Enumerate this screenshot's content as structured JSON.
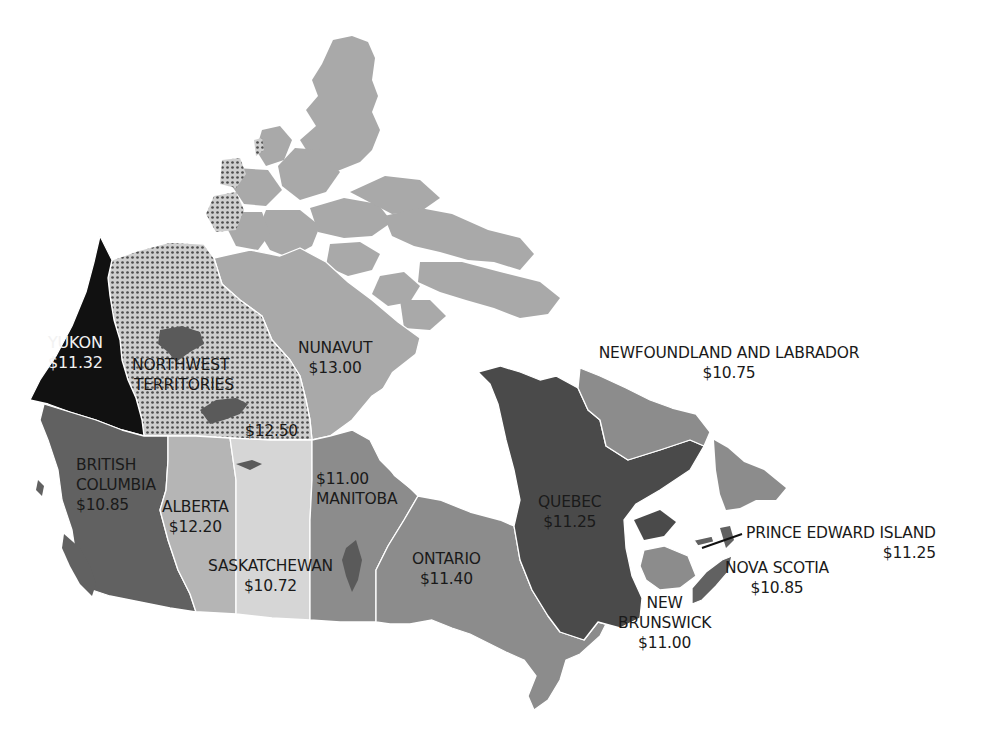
{
  "map": {
    "type": "choropleth",
    "subject": "Canada provinces and territories",
    "colors": {
      "black": "#111111",
      "dark": "#4a4a4a",
      "darkmid": "#616161",
      "mid": "#8c8c8c",
      "lightmid": "#a9a9a9",
      "light": "#b5b5b5",
      "lightest": "#d6d6d6",
      "dotted_base": "#c8c8c8",
      "dot": "#555555",
      "lake": "#5a5a5a",
      "background": "#ffffff"
    },
    "regions": [
      {
        "id": "yukon",
        "name_lines": [
          "YUKON"
        ],
        "value": "$11.32",
        "shade": "black"
      },
      {
        "id": "northwest-territories",
        "name_lines": [
          "NORTHWEST",
          "TERRITORIES"
        ],
        "value": "$12.50",
        "shade": "dotted"
      },
      {
        "id": "nunavut",
        "name_lines": [
          "NUNAVUT"
        ],
        "value": "$13.00",
        "shade": "lightmid"
      },
      {
        "id": "british-columbia",
        "name_lines": [
          "BRITISH",
          "COLUMBIA"
        ],
        "value": "$10.85",
        "shade": "darkmid"
      },
      {
        "id": "alberta",
        "name_lines": [
          "ALBERTA"
        ],
        "value": "$12.20",
        "shade": "light"
      },
      {
        "id": "saskatchewan",
        "name_lines": [
          "SASKATCHEWAN"
        ],
        "value": "$10.72",
        "shade": "lightest"
      },
      {
        "id": "manitoba",
        "name_lines": [
          "MANITOBA"
        ],
        "value": "$11.00",
        "shade": "mid"
      },
      {
        "id": "ontario",
        "name_lines": [
          "ONTARIO"
        ],
        "value": "$11.40",
        "shade": "mid"
      },
      {
        "id": "quebec",
        "name_lines": [
          "QUEBEC"
        ],
        "value": "$11.25",
        "shade": "dark"
      },
      {
        "id": "newfoundland-and-labrador",
        "name_lines": [
          "NEWFOUNDLAND AND LABRADOR"
        ],
        "value": "$10.75",
        "shade": "mid"
      },
      {
        "id": "new-brunswick",
        "name_lines": [
          "NEW",
          "BRUNSWICK"
        ],
        "value": "$11.00",
        "shade": "mid"
      },
      {
        "id": "nova-scotia",
        "name_lines": [
          "NOVA SCOTIA"
        ],
        "value": "$10.85",
        "shade": "darkmid"
      },
      {
        "id": "prince-edward-island",
        "name_lines": [
          "PRINCE EDWARD ISLAND"
        ],
        "value": "$11.25",
        "shade": "darkmid"
      }
    ]
  },
  "labels": {
    "yukon": {
      "l1": "YUKON",
      "v": "$11.32"
    },
    "nwt": {
      "l1": "NORTHWEST",
      "l2": "TERRITORIES",
      "v": "$12.50"
    },
    "nunavut": {
      "l1": "NUNAVUT",
      "v": "$13.00"
    },
    "bc": {
      "l1": "BRITISH",
      "l2": "COLUMBIA",
      "v": "$10.85"
    },
    "alberta": {
      "l1": "ALBERTA",
      "v": "$12.20"
    },
    "sask": {
      "l1": "SASKATCHEWAN",
      "v": "$10.72"
    },
    "manitoba": {
      "v": "$11.00",
      "l1": "MANITOBA"
    },
    "ontario": {
      "l1": "ONTARIO",
      "v": "$11.40"
    },
    "quebec": {
      "l1": "QUEBEC",
      "v": "$11.25"
    },
    "nl": {
      "l1": "NEWFOUNDLAND AND LABRADOR",
      "v": "$10.75"
    },
    "nb": {
      "l1": "NEW",
      "l2": "BRUNSWICK",
      "v": "$11.00"
    },
    "ns": {
      "l1": "NOVA SCOTIA",
      "v": "$10.85"
    },
    "pei": {
      "l1": "PRINCE EDWARD ISLAND",
      "v": "$11.25"
    }
  }
}
